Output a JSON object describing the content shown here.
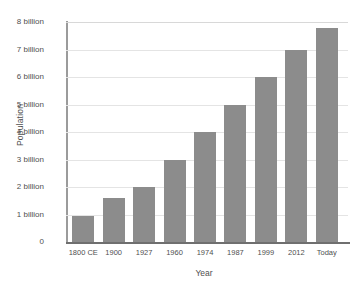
{
  "chart_data": {
    "type": "bar",
    "title": "",
    "xlabel": "Year",
    "ylabel": "Population",
    "categories": [
      "1800 CE",
      "1900",
      "1927",
      "1960",
      "1974",
      "1987",
      "1999",
      "2012",
      "Today"
    ],
    "values": [
      0.95,
      1.6,
      2,
      3,
      4,
      5,
      6,
      7,
      7.8
    ],
    "value_unit": "billion",
    "ylim": [
      0,
      8
    ],
    "ytick_values": [
      0,
      1,
      2,
      3,
      4,
      5,
      6,
      7,
      8
    ],
    "ytick_labels": [
      "0",
      "1 billion",
      "2 billion",
      "3 billion",
      "4 billion",
      "5 billion",
      "6 billion",
      "7 billion",
      "8 billion"
    ],
    "grid": true,
    "legend": false,
    "bar_color": "#8c8c8c",
    "gridline_color": "#e4e4e4",
    "axis_color": "#6f6f6f",
    "background": "#ffffff"
  }
}
